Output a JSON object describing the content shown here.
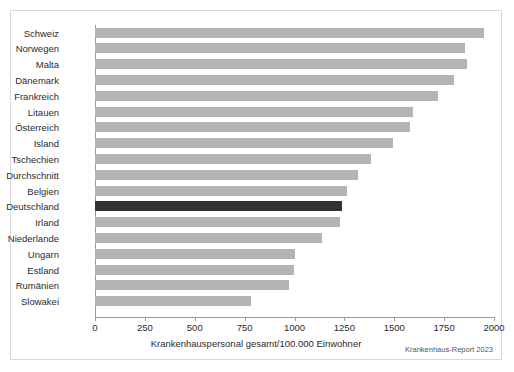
{
  "chart_data": {
    "type": "bar",
    "orientation": "horizontal",
    "title": "",
    "xlabel": "Krankenhauspersonal gesamt/100.000 Einwohner",
    "ylabel": "",
    "xlim": [
      0,
      2000
    ],
    "xticks": [
      0,
      250,
      500,
      750,
      1000,
      1250,
      1500,
      1750,
      2000
    ],
    "xtick_labels": [
      "0",
      "250",
      "500",
      "750",
      "1000",
      "1250",
      "1500",
      "1750",
      "2000"
    ],
    "grid": false,
    "legend": null,
    "categories": [
      "Schweiz",
      "Norwegen",
      "Malta",
      "Dänemark",
      "Frankreich",
      "Litauen",
      "Österreich",
      "Island",
      "Tschechien",
      "Durchschnitt",
      "Belgien",
      "Deutschland",
      "Irland",
      "Niederlande",
      "Ungarn",
      "Estland",
      "Rumänien",
      "Slowakei"
    ],
    "values": [
      1950,
      1855,
      1865,
      1800,
      1720,
      1595,
      1580,
      1495,
      1385,
      1320,
      1265,
      1240,
      1230,
      1140,
      1000,
      995,
      970,
      780
    ],
    "highlight_category": "Deutschland",
    "colors": {
      "bar": "#b3b3b3",
      "highlight": "#333333",
      "axis": "#9a9a9a",
      "text": "#2b2b2b",
      "border": "#d8d8d8",
      "background": "#ffffff"
    }
  },
  "source_note": "Krankenhaus-Report 2023"
}
